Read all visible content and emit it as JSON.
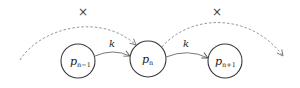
{
  "diagram": {
    "type": "linked-nodes",
    "nodes": [
      {
        "id": "prev",
        "label": "p",
        "subscript": "n−1"
      },
      {
        "id": "curr",
        "label": "p",
        "subscript": "n"
      },
      {
        "id": "next",
        "label": "p",
        "subscript": "n+1"
      }
    ],
    "edges": [
      {
        "from": "prev",
        "to": "curr",
        "style": "solid",
        "label": "k"
      },
      {
        "from": "curr",
        "to": "next",
        "style": "solid",
        "label": "k"
      },
      {
        "from": "outside-left",
        "to": "curr",
        "style": "dashed",
        "label": "×"
      },
      {
        "from": "curr",
        "to": "outside-right",
        "style": "dashed",
        "label": "×"
      }
    ],
    "colors": {
      "node_stroke": "#3a3a3a",
      "solid_edge": "#6a6a6a",
      "dashed_edge": "#8a8a8a",
      "background": "#ffffff"
    }
  }
}
